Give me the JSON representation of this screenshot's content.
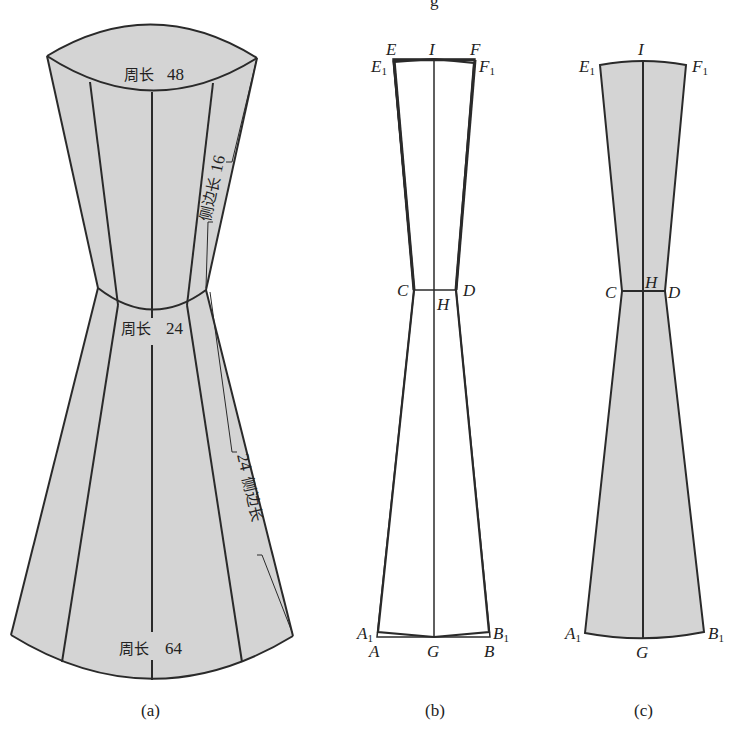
{
  "figure": {
    "partial_top_text": "g",
    "colors": {
      "fill": "#d4d4d4",
      "stroke": "#2a2a2a",
      "background": "#ffffff"
    }
  },
  "panel_a": {
    "caption": "(a)",
    "top_circumference": {
      "label": "周长",
      "value": "48"
    },
    "waist_circumference": {
      "label": "周长",
      "value": "24"
    },
    "bottom_circumference": {
      "label": "周长",
      "value": "64"
    },
    "upper_side_length": {
      "label": "侧边长",
      "value": "16"
    },
    "lower_side_length": {
      "label": "侧边长",
      "value": "24"
    }
  },
  "panel_b": {
    "caption": "(b)",
    "points": {
      "E": "E",
      "F": "F",
      "E1": "E",
      "F1": "F",
      "I": "I",
      "C": "C",
      "D": "D",
      "H": "H",
      "A": "A",
      "B": "B",
      "A1": "A",
      "B1": "B",
      "G": "G",
      "sub1": "1"
    }
  },
  "panel_c": {
    "caption": "(c)",
    "points": {
      "E1": "E",
      "F1": "F",
      "I": "I",
      "C": "C",
      "D": "D",
      "H": "H",
      "A1": "A",
      "B1": "B",
      "G": "G",
      "sub1": "1"
    }
  }
}
